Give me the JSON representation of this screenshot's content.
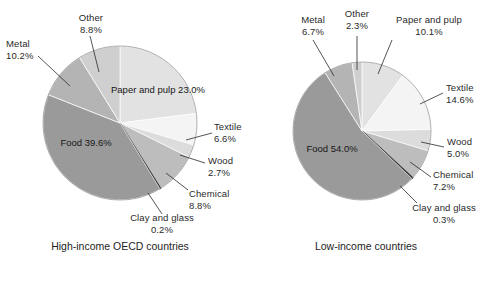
{
  "chart_data": [
    {
      "type": "pie",
      "title": "High-income OECD countries",
      "title_lines": [
        "High-income",
        "OECD countries"
      ],
      "unit": "%",
      "categories": [
        "Paper and pulp",
        "Textile",
        "Wood",
        "Chemical",
        "Clay and glass",
        "Food",
        "Metal",
        "Other"
      ],
      "values": [
        23.0,
        6.6,
        2.7,
        8.8,
        0.2,
        39.6,
        10.2,
        8.8
      ],
      "labels": [
        "23.0%",
        "6.6%",
        "2.7%",
        "8.8%",
        "0.2%",
        "39.6%",
        "10.2%",
        "8.8%"
      ],
      "colors": [
        "#e2e2e2",
        "#f4f4f4",
        "#dcdcdc",
        "#bdbdbd",
        "#3a3a3a",
        "#9a9a9a",
        "#b4b4b4",
        "#cfcfcf"
      ],
      "legend": "none",
      "grid": false
    },
    {
      "type": "pie",
      "title": "Low-income countries",
      "title_lines": [
        "Low-income",
        "countries"
      ],
      "unit": "%",
      "categories": [
        "Paper and pulp",
        "Textile",
        "Wood",
        "Chemical",
        "Clay and glass",
        "Food",
        "Metal",
        "Other"
      ],
      "values": [
        10.1,
        14.6,
        5.0,
        7.2,
        0.3,
        54.0,
        6.7,
        2.3
      ],
      "labels": [
        "10.1%",
        "14.6%",
        "5.0%",
        "7.2%",
        "0.3%",
        "54.0%",
        "6.7%",
        "2.3%"
      ],
      "colors": [
        "#e2e2e2",
        "#f4f4f4",
        "#dcdcdc",
        "#bdbdbd",
        "#3a3a3a",
        "#9a9a9a",
        "#b4b4b4",
        "#cfcfcf"
      ],
      "legend": "none",
      "grid": false
    }
  ],
  "left": {
    "caption_line1": "High-income",
    "caption_line2": "OECD countries",
    "callouts": {
      "other_name": "Other",
      "other_value": "8.8%",
      "metal_name": "Metal",
      "metal_value": "10.2%",
      "textile_name": "Textile",
      "textile_value": "6.6%",
      "wood_name": "Wood",
      "wood_value": "2.7%",
      "chemical_name": "Chemical",
      "chemical_value": "8.8%",
      "clay_name": "Clay and glass",
      "clay_value": "0.2%"
    },
    "inside": {
      "paper_name": "Paper and pulp",
      "paper_value": "23.0%",
      "food_name": "Food",
      "food_value": "39.6%"
    }
  },
  "right": {
    "caption_line1": "Low-income",
    "caption_line2": "countries",
    "callouts": {
      "metal_name": "Metal",
      "metal_value": "6.7%",
      "other_name": "Other",
      "other_value": "2.3%",
      "paper_name": "Paper and pulp",
      "paper_value": "10.1%",
      "textile_name": "Textile",
      "textile_value": "14.6%",
      "wood_name": "Wood",
      "wood_value": "5.0%",
      "chemical_name": "Chemical",
      "chemical_value": "7.2%",
      "clay_name": "Clay and glass",
      "clay_value": "0.3%"
    },
    "inside": {
      "food_name": "Food",
      "food_value": "54.0%"
    }
  }
}
